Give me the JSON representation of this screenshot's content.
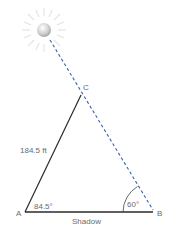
{
  "diagram": {
    "type": "triangle-sun-shadow",
    "vertices": {
      "A": {
        "label": "A",
        "x": 25,
        "y": 212
      },
      "B": {
        "label": "B",
        "x": 153,
        "y": 212
      },
      "C": {
        "label": "C",
        "x": 81,
        "y": 95
      }
    },
    "sun": {
      "x": 44,
      "y": 30,
      "r": 7
    },
    "side_AC_label": "184.5 ft",
    "angle_A_label": "84.5°",
    "angle_B_label": "60°",
    "base_label": "Shadow",
    "colors": {
      "solid_line": "#2a2a2a",
      "dashed_line": "#3a5fb0",
      "sun_fill": "#d8d8d8",
      "ray": "#e2e2e2",
      "text": "#6a6a6a"
    }
  }
}
